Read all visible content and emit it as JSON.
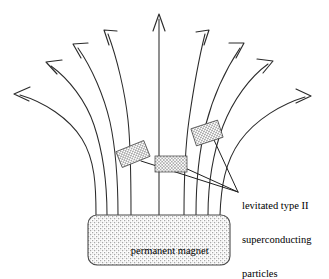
{
  "figure": {
    "kind": "physics-diagram",
    "background_color": "#ffffff",
    "line_color": "#2b2b2b",
    "text_color": "#000000"
  },
  "magnet": {
    "label": "permanent magnet",
    "fill_pattern": "stipple",
    "border_color": "#4a4a4a",
    "x": 88,
    "y": 215,
    "width": 142,
    "height": 50,
    "corner_radius": 9
  },
  "callout": {
    "lines": [
      "levitated type II",
      "superconducting",
      "particles"
    ],
    "full_text": "levitated type II superconducting particles",
    "converge_x": 238,
    "converge_y": 192
  },
  "particles": [
    {
      "name": "particle-left",
      "cx": 133,
      "cy": 154,
      "w": 30,
      "h": 17,
      "rotation": -22
    },
    {
      "name": "particle-center",
      "cx": 171,
      "cy": 164,
      "w": 32,
      "h": 16,
      "rotation": 0
    },
    {
      "name": "particle-right",
      "cx": 207,
      "cy": 133,
      "w": 28,
      "h": 18,
      "rotation": -18
    }
  ],
  "field_lines": [
    {
      "name": "fieldline-1",
      "base_x": 96,
      "tip_x": 14,
      "tip_y": 94,
      "direction": "far-left"
    },
    {
      "name": "fieldline-2",
      "base_x": 106,
      "tip_x": 46,
      "tip_y": 62,
      "direction": "left-outer"
    },
    {
      "name": "fieldline-3",
      "base_x": 117,
      "tip_x": 73,
      "tip_y": 44,
      "direction": "left-mid"
    },
    {
      "name": "fieldline-4",
      "base_x": 130,
      "tip_x": 105,
      "tip_y": 30,
      "direction": "left-inner"
    },
    {
      "name": "fieldline-5",
      "base_x": 159,
      "tip_x": 159,
      "tip_y": 14,
      "direction": "vertical"
    },
    {
      "name": "fieldline-6",
      "base_x": 184,
      "tip_x": 206,
      "tip_y": 29,
      "direction": "right-inner"
    },
    {
      "name": "fieldline-7",
      "base_x": 196,
      "tip_x": 241,
      "tip_y": 44,
      "direction": "right-mid"
    },
    {
      "name": "fieldline-8",
      "base_x": 208,
      "tip_x": 270,
      "tip_y": 61,
      "direction": "right-outer"
    },
    {
      "name": "fieldline-9",
      "base_x": 220,
      "tip_x": 311,
      "tip_y": 96,
      "direction": "far-right"
    }
  ],
  "field_line_count": 9,
  "particle_count": 3
}
